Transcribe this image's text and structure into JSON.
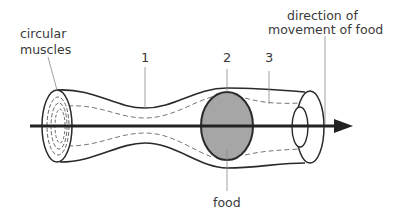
{
  "diagram": {
    "labels": {
      "circular_muscles_line1": "circular",
      "circular_muscles_line2": "muscles",
      "direction_line1": "direction of",
      "direction_line2": "movement of food",
      "marker_1": "1",
      "marker_2": "2",
      "marker_3": "3",
      "food": "food"
    },
    "colors": {
      "outline": "#2a2a2a",
      "dashed": "#777777",
      "food_fill": "#a6a6a6",
      "arrow": "#222222",
      "leader_line": "#888888",
      "text": "#3a3a3a"
    }
  }
}
